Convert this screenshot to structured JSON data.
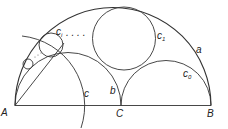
{
  "labels": {
    "A": "A",
    "B": "B",
    "C": "C",
    "a": "a",
    "b": "b",
    "c": "c",
    "c1": "c",
    "c1_sub": "1",
    "c0": "c",
    "c0_sub": "0",
    "ci": "c",
    "ci_sub": "i",
    "dots": ". . . ."
  }
}
